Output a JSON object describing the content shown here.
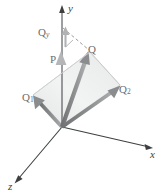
{
  "figure": {
    "background": "#ffffff",
    "axes": {
      "y_label": "y",
      "x_label": "x",
      "z_label": "z",
      "axis_color": "#3d3f41"
    },
    "vectors": {
      "P": "P",
      "Q": "Q",
      "Q1_base": "Q",
      "Q1_sub": "1",
      "Q2_base": "Q",
      "Q2_sub": "2",
      "Qy_base": "Q",
      "Qy_sub": "y"
    },
    "colors": {
      "arrow_fill": "#8a8c8e",
      "arrow_light": "#b9babc",
      "plane_fill": "#eceded",
      "plane_stroke": "#cfd0d1",
      "dashed": "#9a9c9e",
      "label": "#6b6d6f"
    },
    "geometry": {
      "origin": [
        62,
        127
      ],
      "P_tip": [
        62,
        55
      ],
      "Q_tip": [
        90,
        52
      ],
      "Q1_tip": [
        33,
        95
      ],
      "Q2_tip": [
        120,
        85
      ],
      "y_axis_top": [
        62,
        8
      ],
      "x_axis_end": [
        152,
        148
      ],
      "z_axis_end": [
        14,
        184
      ],
      "dash_start": [
        62,
        27
      ],
      "Qy_tip": [
        64,
        28
      ]
    }
  }
}
